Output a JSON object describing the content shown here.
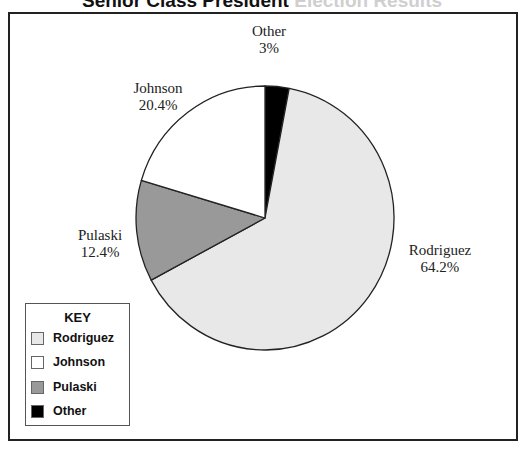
{
  "title": {
    "visible": "Senior Class President",
    "faded": "Election Results"
  },
  "chart_data": {
    "type": "pie",
    "title": "Senior Class President Election Results",
    "start_angle_deg": 0,
    "direction": "clockwise",
    "slices": [
      {
        "name": "Other",
        "value": 3,
        "label": "3%",
        "color": "#000000"
      },
      {
        "name": "Rodriguez",
        "value": 64.2,
        "label": "64.2%",
        "color": "#e8e8e8"
      },
      {
        "name": "Pulaski",
        "value": 12.4,
        "label": "12.4%",
        "color": "#999999"
      },
      {
        "name": "Johnson",
        "value": 20.4,
        "label": "20.4%",
        "color": "#ffffff"
      }
    ],
    "legend": {
      "title": "KEY",
      "position": "bottom-left",
      "entries": [
        "Rodriguez",
        "Johnson",
        "Pulaski",
        "Other"
      ]
    }
  },
  "labels": {
    "other": {
      "name": "Other",
      "pct": "3%"
    },
    "johnson": {
      "name": "Johnson",
      "pct": "20.4%"
    },
    "pulaski": {
      "name": "Pulaski",
      "pct": "12.4%"
    },
    "rodriguez": {
      "name": "Rodriguez",
      "pct": "64.2%"
    }
  },
  "key": {
    "title": "KEY",
    "items": [
      {
        "label": "Rodriguez",
        "color": "#e8e8e8"
      },
      {
        "label": "Johnson",
        "color": "#ffffff"
      },
      {
        "label": "Pulaski",
        "color": "#999999"
      },
      {
        "label": "Other",
        "color": "#000000"
      }
    ]
  }
}
